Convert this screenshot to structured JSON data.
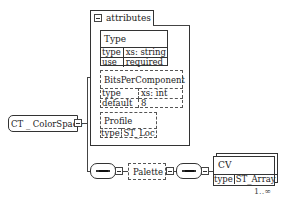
{
  "root": {
    "label": "CT _ ColorSpace"
  },
  "attributes_group": {
    "label": "attributes",
    "items": [
      {
        "name": "Type",
        "optional": false,
        "rows": [
          {
            "key": "type",
            "value": "xs: string"
          },
          {
            "key": "use",
            "value": "required"
          }
        ]
      },
      {
        "name": "BitsPerComponent",
        "optional": true,
        "rows": [
          {
            "key": "type",
            "value": "xs: int"
          },
          {
            "key": "default",
            "value": "8"
          }
        ]
      },
      {
        "name": "Profile",
        "optional": true,
        "rows": [
          {
            "key": "type",
            "value": "ST_Loc"
          }
        ]
      }
    ]
  },
  "sequence": {
    "first_compositor": "sequence",
    "optional_element": {
      "name": "Palette"
    },
    "second_compositor": "sequence",
    "element": {
      "name": "CV",
      "rows": [
        {
          "key": "type",
          "value": "ST_Array"
        }
      ],
      "cardinality": "1..∞"
    }
  }
}
